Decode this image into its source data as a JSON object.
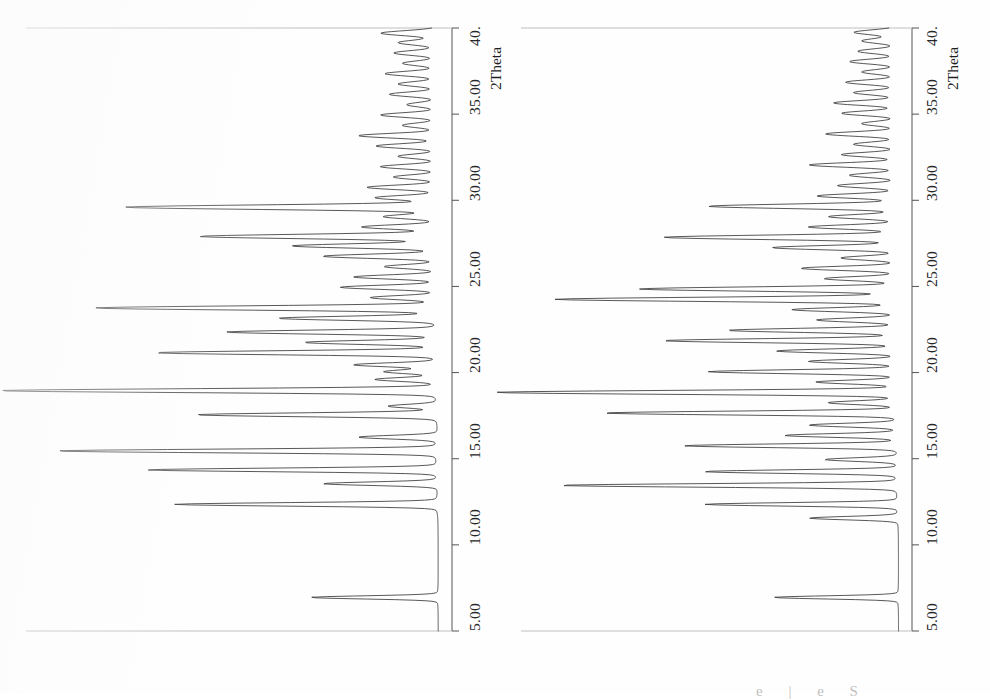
{
  "figure": {
    "kind": "xrd-diffractogram-pair",
    "orientation": "rotated-90-ccw",
    "background_color": "#fefefe",
    "trace_color": "#3a3a3a",
    "axis_color": "#555555",
    "edge_caption": "e | e S"
  },
  "axis": {
    "title": "2Theta",
    "tick_labels": [
      "5.00",
      "10.00",
      "15.00",
      "20.00",
      "25.00",
      "30.00",
      "35.00",
      "40."
    ],
    "tick_values": [
      5,
      10,
      15,
      20,
      25,
      30,
      35,
      40
    ],
    "min": 5,
    "max": 40
  },
  "chart_data": [
    {
      "type": "line",
      "name": "pattern-left",
      "title": "",
      "xlabel": "2Theta",
      "ylabel": "Intensity",
      "xlim": [
        5,
        40
      ],
      "ylim": [
        0,
        100
      ],
      "grid": false,
      "legend": "none",
      "x": [
        6.95,
        12.35,
        13.55,
        14.35,
        15.45,
        16.25,
        17.55,
        18.05,
        18.95,
        19.6,
        20.05,
        20.45,
        21.15,
        21.75,
        22.35,
        23.15,
        23.75,
        24.35,
        24.95,
        25.55,
        26.15,
        26.75,
        27.35,
        27.9,
        28.45,
        29.05,
        29.6,
        30.15,
        30.75,
        31.35,
        31.95,
        32.55,
        33.15,
        33.75,
        34.35,
        34.95,
        35.55,
        36.15,
        36.75,
        37.35,
        37.95,
        38.55,
        39.15,
        39.7
      ],
      "values": [
        29,
        60,
        26,
        66,
        87,
        18,
        55,
        11,
        100,
        14,
        12,
        19,
        64,
        30,
        48,
        36,
        78,
        15,
        22,
        19,
        12,
        26,
        33,
        54,
        17,
        12,
        71,
        14,
        16,
        10,
        13,
        9,
        14,
        18,
        8,
        13,
        7,
        11,
        9,
        12,
        8,
        10,
        9,
        13
      ]
    },
    {
      "type": "line",
      "name": "pattern-right",
      "title": "",
      "xlabel": "2Theta",
      "ylabel": "Intensity",
      "xlim": [
        5,
        40
      ],
      "ylim": [
        0,
        100
      ],
      "grid": false,
      "legend": "none",
      "x": [
        6.95,
        11.55,
        12.35,
        13.45,
        14.25,
        14.95,
        15.75,
        16.35,
        16.95,
        17.65,
        18.25,
        18.85,
        19.45,
        20.05,
        20.65,
        21.25,
        21.85,
        22.45,
        23.05,
        23.65,
        24.25,
        24.85,
        25.45,
        26.05,
        26.65,
        27.25,
        27.85,
        28.45,
        29.05,
        29.65,
        30.25,
        30.85,
        31.45,
        32.05,
        32.65,
        33.25,
        33.85,
        34.45,
        35.05,
        35.65,
        36.25,
        36.85,
        37.45,
        38.05,
        38.65,
        39.25,
        39.75
      ],
      "values": [
        31,
        22,
        48,
        84,
        48,
        18,
        53,
        28,
        22,
        73,
        17,
        100,
        20,
        47,
        22,
        30,
        58,
        42,
        20,
        26,
        85,
        64,
        18,
        24,
        14,
        31,
        58,
        22,
        17,
        47,
        20,
        15,
        12,
        22,
        14,
        11,
        18,
        9,
        14,
        16,
        11,
        13,
        9,
        12,
        10,
        9,
        11
      ]
    }
  ]
}
